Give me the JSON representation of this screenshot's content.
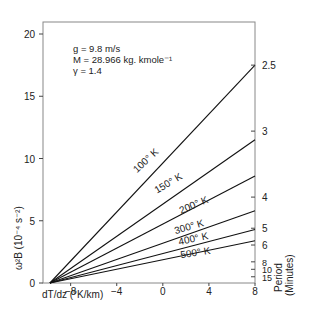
{
  "chart_data": {
    "type": "line",
    "title": "",
    "xlabel": "dT/dz (°K/km)",
    "ylabel": "ω²_B (10⁻⁴ s⁻²)",
    "y2label": [
      "Period",
      "(Minutes)"
    ],
    "xlim": [
      -11,
      8
    ],
    "ylim": [
      0,
      21
    ],
    "x_ticks": [
      -8,
      -4,
      0,
      4,
      8
    ],
    "y_ticks": [
      0,
      5,
      10,
      15,
      20
    ],
    "y2_ticks": [
      {
        "label": "2.5",
        "omega2": 17.5
      },
      {
        "label": "3",
        "omega2": 12.2
      },
      {
        "label": "4",
        "omega2": 6.9
      },
      {
        "label": "5",
        "omega2": 4.4
      },
      {
        "label": "6",
        "omega2": 3.05
      },
      {
        "label": "8",
        "omega2": 1.7
      },
      {
        "label": "10",
        "omega2": 1.1
      },
      {
        "label": "15",
        "omega2": 0.5
      }
    ],
    "grid": false,
    "annotation": [
      "g = 9.8 m/s",
      "M = 28.966 kg. kmole⁻¹",
      "γ = 1.4"
    ],
    "series": [
      {
        "name": "100° K",
        "x": [
          -9.8,
          8
        ],
        "y": [
          0,
          17.5
        ]
      },
      {
        "name": "150° K",
        "x": [
          -9.8,
          8
        ],
        "y": [
          0,
          11.5
        ]
      },
      {
        "name": "200° K",
        "x": [
          -9.8,
          8
        ],
        "y": [
          0,
          8.6
        ]
      },
      {
        "name": "300° K",
        "x": [
          -9.8,
          8
        ],
        "y": [
          0,
          5.8
        ]
      },
      {
        "name": "400° K",
        "x": [
          -9.8,
          8
        ],
        "y": [
          0,
          4.3
        ]
      },
      {
        "name": "500° K",
        "x": [
          -9.8,
          8
        ],
        "y": [
          0,
          3.4
        ]
      }
    ]
  },
  "labels": {
    "param_g": "g  =  9.8  m/s",
    "param_M": "M =  28.966 kg. kmole⁻¹",
    "param_gamma": "γ  =  1.4",
    "xlabel": "dT/dz (°K/km)",
    "ylabel": "ω²B (10⁻⁴ s⁻²)",
    "period1": "Period",
    "period2": "(Minutes)"
  }
}
